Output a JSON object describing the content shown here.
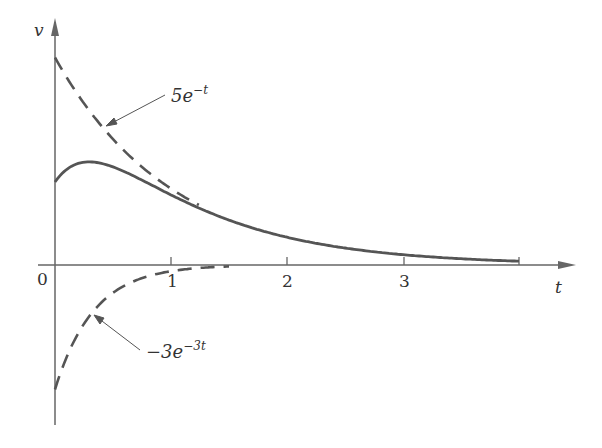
{
  "chart_data": {
    "type": "line",
    "title": "",
    "xlabel": "t",
    "ylabel": "v",
    "xlim": [
      0,
      4.6
    ],
    "ylim": [
      -4.2,
      5.8
    ],
    "grid": false,
    "legend": "none (inline annotations with arrows)",
    "x_ticks": [
      "0",
      "1",
      "2",
      "3"
    ],
    "x_tick_positions": [
      0,
      1,
      2,
      3,
      4
    ],
    "series": [
      {
        "name": "5e^{-t}",
        "style": "dashed",
        "formula": "5*exp(-t)",
        "x": [
          0,
          0.25,
          0.5,
          0.75,
          1.0,
          1.25
        ],
        "values": [
          5.0,
          3.89,
          3.03,
          2.36,
          1.84,
          1.43
        ]
      },
      {
        "name": "-3e^{-3t}",
        "style": "dashed",
        "formula": "-3*exp(-3t)",
        "x": [
          0,
          0.25,
          0.5,
          0.75,
          1.0,
          1.25,
          1.5
        ],
        "values": [
          -3.0,
          -1.42,
          -0.67,
          -0.32,
          -0.15,
          -0.07,
          -0.03
        ]
      },
      {
        "name": "v = 5e^{-t} - 3e^{-3t}",
        "style": "solid",
        "formula": "5*exp(-t) - 3*exp(-3t)",
        "x": [
          0,
          0.25,
          0.5,
          0.75,
          1.0,
          1.5,
          2.0,
          2.5,
          3.0,
          3.5,
          4.0
        ],
        "values": [
          2.0,
          2.47,
          2.36,
          2.04,
          1.69,
          1.09,
          0.67,
          0.41,
          0.25,
          0.15,
          0.09
        ]
      }
    ],
    "annotations": [
      {
        "text": "5e^{-t}",
        "points_to": "upper dashed curve near t=0.5"
      },
      {
        "text": "-3e^{-3t}",
        "points_to": "lower dashed curve near t=0.4"
      }
    ]
  },
  "labels": {
    "y_axis": "v",
    "x_axis": "t",
    "origin": "0",
    "tick1": "1",
    "tick2": "2",
    "tick3": "3",
    "anno_upper_base": "5e",
    "anno_upper_exp": "−t",
    "anno_lower_base": "−3e",
    "anno_lower_exp": "−3t"
  },
  "colors": {
    "curve": "#555555",
    "axis": "#666666",
    "text": "#333333",
    "background": "#ffffff"
  }
}
